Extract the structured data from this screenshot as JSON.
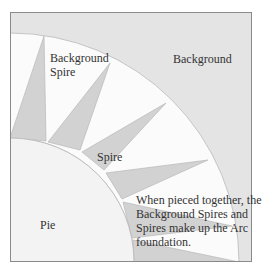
{
  "diagram": {
    "colors": {
      "background": "#e4e4e4",
      "background_spire": "#fbfbfb",
      "spire": "#d2d2d2",
      "pie": "#f3f3f3",
      "border": "#8a8a8a",
      "seam": "#b8b8b8",
      "text": "#333333"
    },
    "labels": {
      "background": "Background",
      "background_spire_line1": "Background",
      "background_spire_line2": "Spire",
      "spire": "Spire",
      "pie": "Pie",
      "note_line1": "When pieced together, the",
      "note_line2": "Background Spires and",
      "note_line3": "Spires make up the Arc",
      "note_line4": "foundation."
    },
    "regions": [
      {
        "name": "Background",
        "description": "outer area beyond the arc"
      },
      {
        "name": "Background Spire",
        "description": "light triangles between spires"
      },
      {
        "name": "Spire",
        "description": "gray triangles pointing outward"
      },
      {
        "name": "Pie",
        "description": "quarter circle in the corner"
      }
    ]
  }
}
